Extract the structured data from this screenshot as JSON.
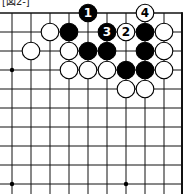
{
  "diagram": {
    "type": "go-board-fragment",
    "label": "[図2-]",
    "grid": {
      "origin_x": 12,
      "origin_y": 13,
      "spacing": 19,
      "cols": 10,
      "rows": 10,
      "right_edge": true,
      "top_edge": true
    },
    "star_points": [
      {
        "col": 0,
        "row": 3
      },
      {
        "col": 0,
        "row": 9
      },
      {
        "col": 6,
        "row": 9
      }
    ],
    "stones": [
      {
        "col": 4,
        "row": 0,
        "color": "black",
        "label": "1"
      },
      {
        "col": 7,
        "row": 0,
        "color": "white",
        "label": "4"
      },
      {
        "col": 2,
        "row": 1,
        "color": "white",
        "label": ""
      },
      {
        "col": 3,
        "row": 1,
        "color": "black",
        "label": ""
      },
      {
        "col": 5,
        "row": 1,
        "color": "black",
        "label": "3"
      },
      {
        "col": 6,
        "row": 1,
        "color": "white",
        "label": "2"
      },
      {
        "col": 7,
        "row": 1,
        "color": "black",
        "label": ""
      },
      {
        "col": 8,
        "row": 1,
        "color": "white",
        "label": ""
      },
      {
        "col": 1,
        "row": 2,
        "color": "white",
        "label": ""
      },
      {
        "col": 3,
        "row": 2,
        "color": "white",
        "label": ""
      },
      {
        "col": 4,
        "row": 2,
        "color": "black",
        "label": ""
      },
      {
        "col": 5,
        "row": 2,
        "color": "black",
        "label": ""
      },
      {
        "col": 7,
        "row": 2,
        "color": "black",
        "label": ""
      },
      {
        "col": 8,
        "row": 2,
        "color": "white",
        "label": ""
      },
      {
        "col": 3,
        "row": 3,
        "color": "white",
        "label": ""
      },
      {
        "col": 4,
        "row": 3,
        "color": "white",
        "label": ""
      },
      {
        "col": 5,
        "row": 3,
        "color": "white",
        "label": ""
      },
      {
        "col": 6,
        "row": 3,
        "color": "black",
        "label": ""
      },
      {
        "col": 7,
        "row": 3,
        "color": "black",
        "label": ""
      },
      {
        "col": 8,
        "row": 3,
        "color": "white",
        "label": ""
      },
      {
        "col": 6,
        "row": 4,
        "color": "white",
        "label": ""
      },
      {
        "col": 7,
        "row": 4,
        "color": "white",
        "label": ""
      }
    ],
    "colors": {
      "black": "#000000",
      "white": "#ffffff",
      "line": "#111111"
    }
  }
}
